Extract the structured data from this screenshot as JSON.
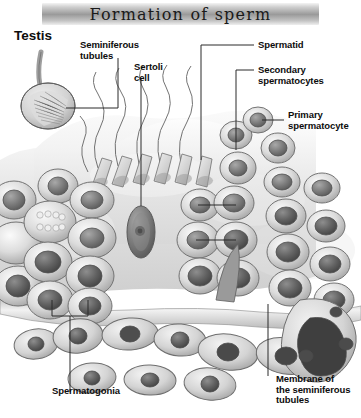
{
  "banner": {
    "title": "Formation of sperm"
  },
  "labels": {
    "testis": "Testis",
    "seminiferous_tubules": "Seminiferous\ntubules",
    "sertoli_cell": "Sertoli\ncell",
    "spermatid": "Spermatid",
    "secondary_spermatocytes": "Secondary\nspermatocytes",
    "primary_spermatocyte": "Primary\nspermatocyte",
    "spermatogonia": "Spermatogonia",
    "membrane": "Membrane of\nthe seminiferous\ntubules"
  },
  "diagram": {
    "type": "anatomical-illustration",
    "style": "grayscale airbrush rendering",
    "parts": [
      {
        "name": "testis",
        "description": "oval organ with spermatic cord, internal striations"
      },
      {
        "name": "spermatids-with-tails",
        "description": "cone-shaped heads with wavy flagella projecting into lumen"
      },
      {
        "name": "sertoli-cell",
        "description": "tall dark elongated cell with prominent nucleolus"
      },
      {
        "name": "spermatogonia",
        "description": "rounded basal cells with dark nuclei"
      },
      {
        "name": "primary-spermatocytes",
        "description": "large round cells with large dark nuclei"
      },
      {
        "name": "secondary-spermatocytes",
        "description": "smaller round cells nearer the lumen"
      },
      {
        "name": "basement-membrane",
        "description": "pale band bounding the epithelium"
      },
      {
        "name": "interstitial-cells",
        "description": "flattened spindle cells outside the membrane"
      }
    ],
    "colors": {
      "background": "#ffffff",
      "banner_mid": "#9a9a9a",
      "tissue_light": "#e9e9e9",
      "tissue_mid": "#bdbdbd",
      "nucleus_dark": "#6f6f6f",
      "line": "#2b2b2b"
    }
  }
}
